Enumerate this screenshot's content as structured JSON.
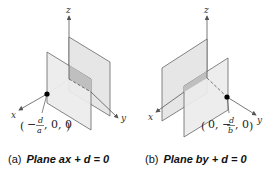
{
  "figures": [
    {
      "id": "a",
      "caption_label": "(a)",
      "caption_text": "Plane ax + d = 0",
      "axes": {
        "x": "x",
        "y": "y",
        "z": "z"
      },
      "point": {
        "open": "(",
        "prefix": "−",
        "num": "d",
        "den": "a",
        "rest": ", 0, 0",
        "close": ")"
      }
    },
    {
      "id": "b",
      "caption_label": "(b)",
      "caption_text": "Plane by + d = 0",
      "axes": {
        "x": "x",
        "y": "y",
        "z": "z"
      },
      "point": {
        "open": "(",
        "first": "0, −",
        "num": "d",
        "den": "b",
        "rest": ", 0",
        "close": ")"
      }
    }
  ],
  "colors": {
    "plane_fill": "#e3e3e3",
    "plane_dark": "#bdbdbd",
    "edge": "#666666",
    "axis": "#555555",
    "point": "#000000"
  }
}
